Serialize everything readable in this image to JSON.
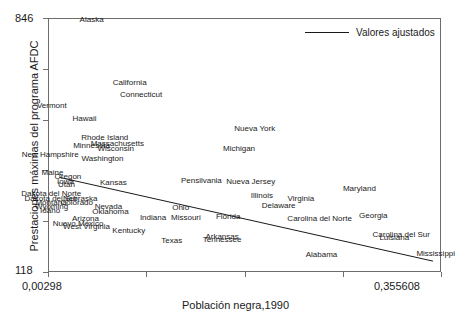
{
  "chart_data": {
    "type": "scatter",
    "title": "",
    "xlabel": "Población negra,1990",
    "ylabel": "Prestaciones máximas del programa AFDC",
    "xlim": [
      0.00298,
      0.355608
    ],
    "ylim": [
      118,
      846
    ],
    "xtick_labels": [
      "0,00298",
      "0,355608"
    ],
    "ytick_labels": [
      "846",
      "118"
    ],
    "grid": false,
    "legend_position": "top-right",
    "legend": [
      {
        "name": "Valores ajustados",
        "marker": "line"
      }
    ],
    "point_style": "text-label-only",
    "fit_line": {
      "name": "Valores ajustados",
      "x_start": 0.0125,
      "y_start": 392,
      "x_end": 0.3475,
      "y_end": 152
    },
    "points": [
      {
        "label": "Alaska",
        "x": 0.0412,
        "y": 842
      },
      {
        "label": "California",
        "x": 0.0754,
        "y": 663
      },
      {
        "label": "Connecticut",
        "x": 0.0856,
        "y": 627
      },
      {
        "label": "Vermont",
        "x": 0.0055,
        "y": 597
      },
      {
        "label": "Hawaii",
        "x": 0.0348,
        "y": 558
      },
      {
        "label": "Nueva York",
        "x": 0.1876,
        "y": 532
      },
      {
        "label": "Rhode Island",
        "x": 0.053,
        "y": 506
      },
      {
        "label": "Massachusetts",
        "x": 0.0643,
        "y": 489
      },
      {
        "label": "Minnesota",
        "x": 0.0412,
        "y": 483
      },
      {
        "label": "Wisconsin",
        "x": 0.0628,
        "y": 472
      },
      {
        "label": "Michigan",
        "x": 0.1735,
        "y": 472
      },
      {
        "label": "New Hampshire",
        "x": 0.004,
        "y": 455
      },
      {
        "label": "Washington",
        "x": 0.051,
        "y": 446
      },
      {
        "label": "Maine",
        "x": 0.0061,
        "y": 406
      },
      {
        "label": "Oregon",
        "x": 0.02,
        "y": 392
      },
      {
        "label": "Iowa",
        "x": 0.0178,
        "y": 380
      },
      {
        "label": "Utah",
        "x": 0.0187,
        "y": 369
      },
      {
        "label": "Kansas",
        "x": 0.0607,
        "y": 375
      },
      {
        "label": "Pensilvania",
        "x": 0.1397,
        "y": 383
      },
      {
        "label": "Nueva Jersey",
        "x": 0.184,
        "y": 378
      },
      {
        "label": "Dakota del Norte",
        "x": 0.005,
        "y": 343
      },
      {
        "label": "Dakota del Sur",
        "x": 0.0048,
        "y": 331
      },
      {
        "label": "Nebraska",
        "x": 0.031,
        "y": 331
      },
      {
        "label": "Montana",
        "x": 0.0048,
        "y": 320
      },
      {
        "label": "Colorado",
        "x": 0.0279,
        "y": 320
      },
      {
        "label": "Illinois",
        "x": 0.194,
        "y": 340
      },
      {
        "label": "Maryland",
        "x": 0.2815,
        "y": 360
      },
      {
        "label": "Wyoming",
        "x": 0.0053,
        "y": 308
      },
      {
        "label": "Nevada",
        "x": 0.0563,
        "y": 308
      },
      {
        "label": "Virginia",
        "x": 0.229,
        "y": 329
      },
      {
        "label": "Ohio",
        "x": 0.1211,
        "y": 303
      },
      {
        "label": "Idaho",
        "x": 0.004,
        "y": 296
      },
      {
        "label": "Oklahoma",
        "x": 0.0581,
        "y": 294
      },
      {
        "label": "Delaware",
        "x": 0.209,
        "y": 311
      },
      {
        "label": "Arizona",
        "x": 0.0357,
        "y": 274
      },
      {
        "label": "Indiana",
        "x": 0.0963,
        "y": 276
      },
      {
        "label": "Missouri",
        "x": 0.1258,
        "y": 276
      },
      {
        "label": "Florida",
        "x": 0.1637,
        "y": 279
      },
      {
        "label": "Georgia",
        "x": 0.294,
        "y": 280
      },
      {
        "label": "Carolina del Norte",
        "x": 0.2458,
        "y": 272
      },
      {
        "label": "Nuevo México",
        "x": 0.029,
        "y": 258
      },
      {
        "label": "West Virginia",
        "x": 0.0366,
        "y": 251
      },
      {
        "label": "Kentucky",
        "x": 0.0746,
        "y": 238
      },
      {
        "label": "Arkansas",
        "x": 0.1583,
        "y": 222
      },
      {
        "label": "Carolina del Sur",
        "x": 0.319,
        "y": 228
      },
      {
        "label": "Tennessee",
        "x": 0.1583,
        "y": 212
      },
      {
        "label": "Luisiana",
        "x": 0.3128,
        "y": 217
      },
      {
        "label": "Texas",
        "x": 0.1131,
        "y": 210
      },
      {
        "label": "Alabama",
        "x": 0.2475,
        "y": 171
      },
      {
        "label": "Mississippi",
        "x": 0.35,
        "y": 173
      }
    ]
  },
  "axes": {
    "x_title": "Población negra,1990",
    "y_title": "Prestaciones máximas del programa AFDC",
    "y_max_tick": "846",
    "y_min_tick": "118",
    "x_min_tick": "0,00298",
    "x_max_tick": "0,355608"
  },
  "legend": {
    "series_label": "Valores ajustados"
  },
  "colors": {
    "frame": "#6d6d6d",
    "text": "#1a1a1a",
    "line": "#1a1a1a",
    "background": "#ffffff"
  }
}
